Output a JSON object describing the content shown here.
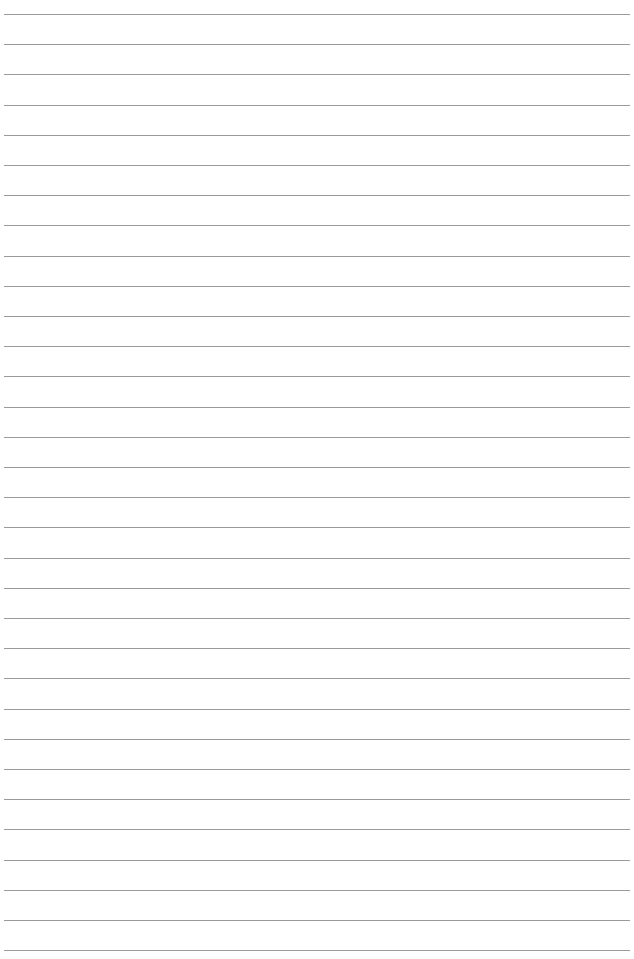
{
  "page": {
    "type": "blank lined paper",
    "background_color": "#ffffff",
    "line_color": "#8a8a8a",
    "line_count": 32,
    "first_line_y": 14,
    "line_spacing": 30.2,
    "line_left": 4,
    "line_width": 626
  }
}
